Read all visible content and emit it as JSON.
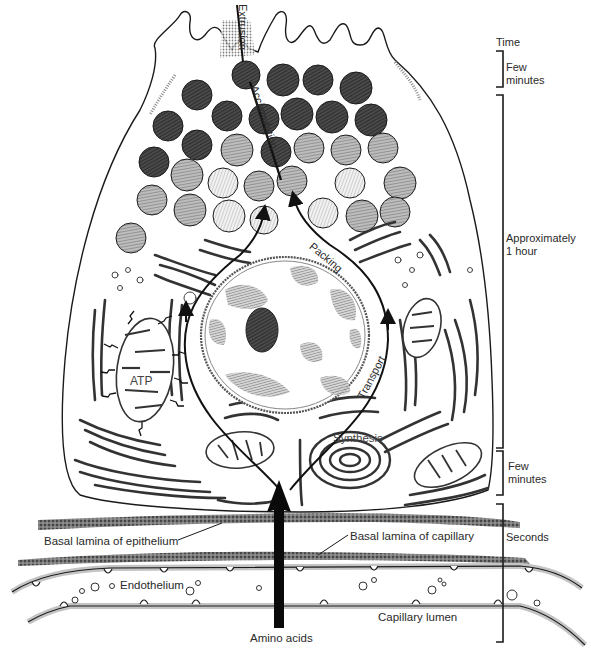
{
  "figure": {
    "colors": {
      "ink": "#1a1a1a",
      "granule_dark": "#3a3a3a",
      "granule_mid": "#8a8a8a",
      "granule_light": "#c4c4c4",
      "lamina": "#6b6b6b",
      "endothelium_halo": "#bdbdbd",
      "chromatin": "#7a7a7a"
    }
  },
  "process_labels": {
    "extrusion": "Extrusion",
    "accumulation": "Accumulation",
    "packing": "Packing",
    "transport": "Transport",
    "synthesis": "Synthesis",
    "atp": "ATP"
  },
  "structure_labels": {
    "basal_lamina_epithelium": "Basal lamina of epithelium",
    "basal_lamina_capillary": "Basal lamina of capillary",
    "endothelium": "Endothelium",
    "capillary_lumen": "Capillary lumen",
    "amino_acids": "Amino acids"
  },
  "timeline": {
    "header": "Time",
    "stages": [
      {
        "label_line1": "Few",
        "label_line2": "minutes",
        "span": "extrusion"
      },
      {
        "label_line1": "Approximately",
        "label_line2": "1 hour",
        "span": "accumulation-packing-transport"
      },
      {
        "label_line1": "Few",
        "label_line2": "minutes",
        "span": "synthesis"
      },
      {
        "label_line1": "Seconds",
        "label_line2": "",
        "span": "amino-acid-entry"
      }
    ]
  }
}
